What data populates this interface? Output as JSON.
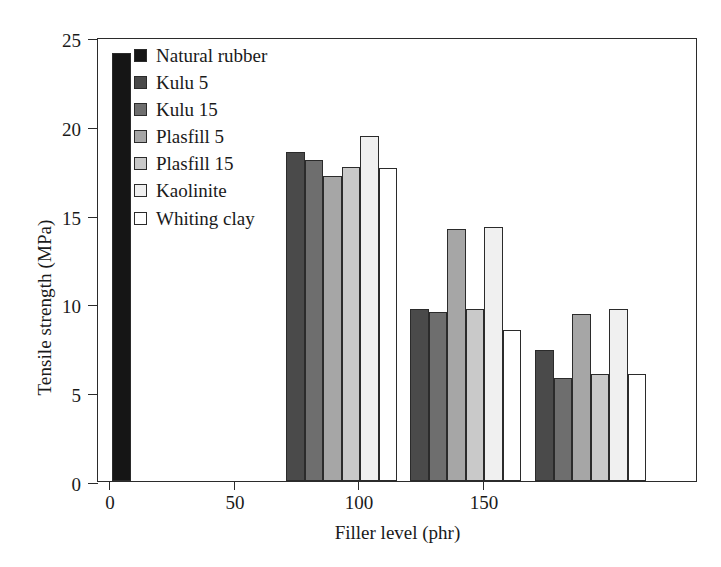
{
  "chart_data": {
    "type": "bar",
    "title": "",
    "xlabel": "Filler level (phr)",
    "ylabel": "Tensile strength (MPa)",
    "categories": [
      "0",
      "50",
      "100",
      "150"
    ],
    "xtick_labels": [
      "0",
      "50",
      "100",
      "150"
    ],
    "ytick_labels": [
      "0",
      "5",
      "10",
      "15",
      "20",
      "25"
    ],
    "ylim": [
      0,
      25
    ],
    "ytick_step": 5,
    "grid": false,
    "legend_position": "upper-left-inside",
    "series": [
      {
        "name": "Natural rubber",
        "color": "#151515",
        "values": [
          24.1,
          null,
          null,
          null
        ]
      },
      {
        "name": "Kulu 5",
        "color": "#4a4a4a",
        "values": [
          null,
          18.5,
          9.7,
          7.4
        ]
      },
      {
        "name": "Kulu 15",
        "color": "#6e6e6e",
        "values": [
          null,
          18.1,
          9.5,
          5.8
        ]
      },
      {
        "name": "Plasfill 5",
        "color": "#a6a6a6",
        "values": [
          null,
          17.2,
          14.2,
          9.4
        ]
      },
      {
        "name": "Plasfill 15",
        "color": "#c9c9c9",
        "values": [
          null,
          17.7,
          9.7,
          6.0
        ]
      },
      {
        "name": "Kaolinite",
        "color": "#f0f0f0",
        "values": [
          null,
          19.45,
          14.3,
          9.7
        ]
      },
      {
        "name": "Whiting clay",
        "color": "#ffffff",
        "values": [
          null,
          17.6,
          8.5,
          6.0
        ]
      }
    ]
  },
  "legend": {
    "items": [
      {
        "label": "Natural rubber",
        "color": "#151515"
      },
      {
        "label": "Kulu 5",
        "color": "#4a4a4a"
      },
      {
        "label": "Kulu 15",
        "color": "#6e6e6e"
      },
      {
        "label": "Plasfill 5",
        "color": "#a6a6a6"
      },
      {
        "label": "Plasfill 15",
        "color": "#c9c9c9"
      },
      {
        "label": "Kaolinite",
        "color": "#f0f0f0"
      },
      {
        "label": "Whiting clay",
        "color": "#ffffff"
      }
    ]
  },
  "axes": {
    "x_title": "Filler level (phr)",
    "y_title": "Tensile strength (MPa)"
  },
  "layout": {
    "plot_left": 97,
    "plot_top": 38,
    "plot_width": 600,
    "plot_height": 444,
    "group_tick_x": [
      11,
      136,
      260,
      385
    ],
    "bar_width": 18.5,
    "group_bar_start_offset": [
      3,
      52,
      52,
      52
    ]
  }
}
